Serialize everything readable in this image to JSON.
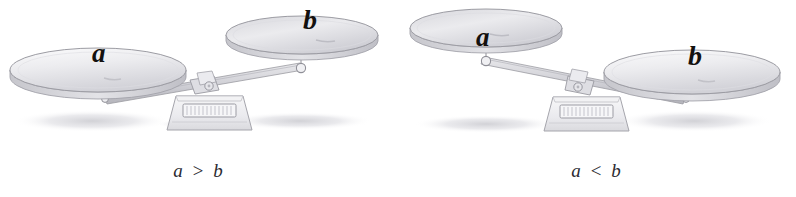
{
  "figure": {
    "background_color": "#ffffff",
    "ink_color": "#8d8d93",
    "label_color": "#14110f",
    "shadow_color": "#d9d9dd",
    "pan_fill_light": "#f4f4f5",
    "pan_fill_mid": "#dcdce0",
    "pan_fill_dark": "#c3c3c9"
  },
  "scales": [
    {
      "id": "scale-left",
      "caption": "a > b",
      "heavier_side": "left",
      "left_pan": {
        "label": "a",
        "state": "down"
      },
      "right_pan": {
        "label": "b",
        "state": "up"
      }
    },
    {
      "id": "scale-right",
      "caption": "a < b",
      "heavier_side": "right",
      "left_pan": {
        "label": "a",
        "state": "up"
      },
      "right_pan": {
        "label": "b",
        "state": "down"
      }
    }
  ]
}
